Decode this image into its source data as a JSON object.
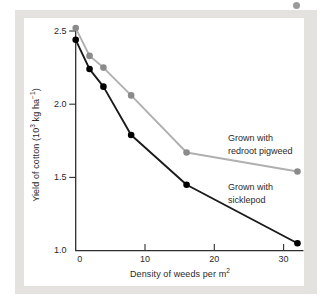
{
  "figure": {
    "page_bg": "#ffffff",
    "panel_bg": "#e3e2df",
    "plot_bg": "#ffffff",
    "axis_color": "#2e2e2e",
    "text_color": "#2a2a2a",
    "stray_dot_color": "#9a9a9a"
  },
  "chart_data": {
    "type": "line",
    "title": "",
    "xlabel": "Density of weeds per m²",
    "ylabel": "Yield of cotton (10³ kg ha⁻¹)",
    "xlabel_parts": {
      "main": "Density of weeds per m",
      "sup": "2"
    },
    "ylabel_parts": {
      "p1": "Yield of cotton (10",
      "sup1": "3",
      "p2": " kg ha",
      "sup2": "−1",
      "p3": ")"
    },
    "xlim": [
      0,
      33
    ],
    "ylim": [
      1.0,
      2.5
    ],
    "x_ticks": [
      0,
      10,
      20,
      30
    ],
    "y_ticks": [
      2.5,
      2.0,
      1.5,
      1.0
    ],
    "grid": false,
    "legend_position": "inline-annotations",
    "series": [
      {
        "name": "Grown with redroot pigweed",
        "label_lines": [
          "Grown with",
          "redroot pigweed"
        ],
        "line_color": "#b0b0b0",
        "marker_color": "#8b8b8b",
        "x": [
          0,
          2,
          4,
          8,
          16,
          32
        ],
        "values": [
          2.52,
          2.33,
          2.25,
          2.06,
          1.67,
          1.54
        ]
      },
      {
        "name": "Grown with sicklepod",
        "label_lines": [
          "Grown with",
          "sicklepod"
        ],
        "line_color": "#1a1a1a",
        "marker_color": "#000000",
        "x": [
          0,
          2,
          4,
          8,
          16,
          32
        ],
        "values": [
          2.44,
          2.24,
          2.12,
          1.79,
          1.45,
          1.05
        ]
      }
    ]
  }
}
